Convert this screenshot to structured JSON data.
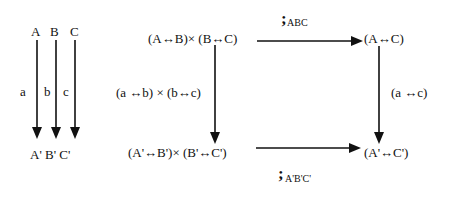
{
  "left_diagram": {
    "top_labels": [
      "A",
      "B",
      "C"
    ],
    "arrow_labels": [
      "a",
      "b",
      "c"
    ],
    "bottom_label": "A' B' C'"
  },
  "square": {
    "top_left": "(A↔B)× (B↔C)",
    "top_right": "(A↔C)",
    "bottom_left": "(A'↔B')× (B'↔C')",
    "bottom_right": "(A'↔C')",
    "left_arrow_label": "(a ↔b) × (b↔c)",
    "right_arrow_label": "(a ↔c)",
    "top_arrow_label": {
      "symbol": ";",
      "subscript": "ABC"
    },
    "bottom_arrow_label": {
      "symbol": ";",
      "subscript": "A'B'C'"
    }
  },
  "colors": {
    "ink": "#111111",
    "background": "#ffffff"
  }
}
